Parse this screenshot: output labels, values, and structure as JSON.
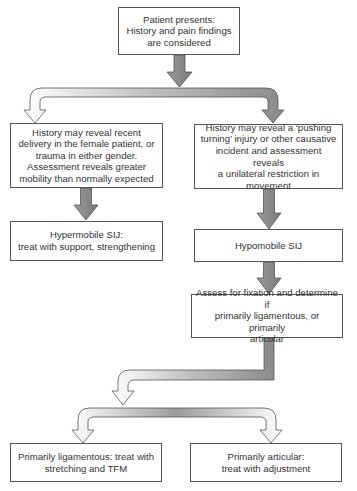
{
  "diagram": {
    "type": "flowchart",
    "colors": {
      "arrow_fill": "#8a8a8a",
      "arrow_light": "#f2f2f2",
      "border": "#555555",
      "text": "#333333"
    },
    "nodes": {
      "start": {
        "text": "Patient presents:\nHistory and pain findings\nare considered"
      },
      "left_history": {
        "text": "History may reveal recent\ndelivery in the female patient, or\ntrauma in either gender.\nAssessment reveals greater\nmobility than normally expected"
      },
      "right_history": {
        "text": "History may reveal a ‘pushing\nturning’ injury or other causative\nincident and assessment reveals\na unilateral restriction in\nmovement"
      },
      "hypermobile": {
        "text": "Hypermobile SIJ:\ntreat with support, strengthening"
      },
      "hypomobile": {
        "text": "Hypomobile SIJ"
      },
      "assess": {
        "text": "Assess for fixation and determine if\nprimarily ligamentous, or primarily\narticular"
      },
      "ligamentous": {
        "text": "Primarily ligamentous: treat with\nstretching and TFM"
      },
      "articular": {
        "text": "Primarily articular:\ntreat with adjustment"
      }
    },
    "edges": [
      {
        "from": "start",
        "to": "left_history"
      },
      {
        "from": "start",
        "to": "right_history"
      },
      {
        "from": "left_history",
        "to": "hypermobile"
      },
      {
        "from": "right_history",
        "to": "hypomobile"
      },
      {
        "from": "hypomobile",
        "to": "assess"
      },
      {
        "from": "assess",
        "to": "ligamentous"
      },
      {
        "from": "assess",
        "to": "articular"
      }
    ]
  }
}
